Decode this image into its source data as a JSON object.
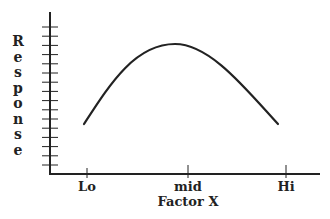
{
  "chart_data": {
    "type": "line",
    "title": "",
    "xlabel": "Factor X",
    "ylabel": "Response",
    "categories": [
      "Lo",
      "mid",
      "Hi"
    ],
    "x_ticks": [
      "Lo",
      "mid",
      "Hi"
    ],
    "y_ticks_count": 16,
    "y_tick_labels": [],
    "series": [
      {
        "name": "Response curve",
        "shape": "inverted-parabola",
        "points": [
          {
            "x": "Lo",
            "y": 5
          },
          {
            "x": "mid",
            "y": 13.5
          },
          {
            "x": "Hi",
            "y": 5
          }
        ]
      }
    ],
    "ylim": [
      0,
      17
    ],
    "grid": false,
    "legend": "none",
    "color": "#222222"
  },
  "axis": {
    "y_title_letters": [
      "R",
      "e",
      "s",
      "p",
      "o",
      "n",
      "s",
      "e"
    ],
    "x_title": "Factor X",
    "x_tick_labels": [
      "Lo",
      "mid",
      "Hi"
    ]
  }
}
